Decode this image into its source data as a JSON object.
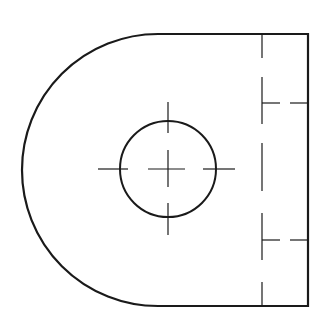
{
  "drawing": {
    "title": "Technical drawing: plate with rounded end, central hole and hidden slots",
    "colors": {
      "background": "#ffffff",
      "line": "#1a1a1a"
    },
    "outline": {
      "top_y": 34,
      "bottom_y": 306,
      "right_x": 308,
      "arc_center": [
        158,
        170
      ],
      "arc_radius": 136,
      "stroke": 2.2
    },
    "hole": {
      "cx": 168,
      "cy": 169,
      "r": 48,
      "stroke": 2
    },
    "centerlines": {
      "horizontal": [
        [
          98,
          128
        ],
        [
          148,
          185
        ],
        [
          203,
          235
        ]
      ],
      "vertical": [
        [
          102,
          133
        ],
        [
          150,
          187
        ],
        [
          203,
          235
        ]
      ]
    },
    "hidden_lines": {
      "vertical_x": 262,
      "vertical_segments": [
        [
          34,
          58
        ],
        [
          77,
          124
        ],
        [
          143,
          191
        ],
        [
          213,
          260
        ],
        [
          282,
          306
        ]
      ],
      "horizontal": [
        {
          "y": 103,
          "segments": [
            [
              262,
              280
            ],
            [
              290,
              308
            ]
          ]
        },
        {
          "y": 240,
          "segments": [
            [
              262,
              280
            ],
            [
              290,
              308
            ]
          ]
        }
      ]
    }
  }
}
